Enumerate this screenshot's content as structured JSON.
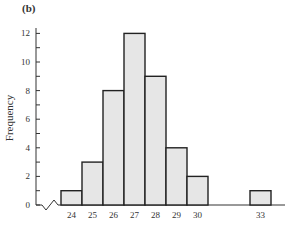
{
  "chart_data": {
    "type": "bar",
    "title": "(b)",
    "xlabel": "",
    "ylabel": "Frequency",
    "categories": [
      "24",
      "25",
      "26",
      "27",
      "28",
      "29",
      "30",
      "33"
    ],
    "values": [
      1,
      3,
      8,
      12,
      9,
      4,
      2,
      1
    ],
    "ylim": [
      0,
      12
    ],
    "yticks": [
      0,
      2,
      4,
      6,
      8,
      10,
      12
    ],
    "grid": false,
    "axis_break": true,
    "bar_color": "#e6e6e6",
    "edge_color": "#222222"
  },
  "labels": {
    "panel": "(b)",
    "ylabel": "Frequency"
  }
}
